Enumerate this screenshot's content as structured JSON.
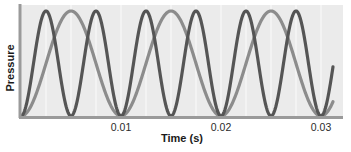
{
  "chart_data": {
    "type": "line",
    "title": "",
    "xlabel": "Time (s)",
    "ylabel": "Pressure",
    "xlim": [
      0,
      0.0322
    ],
    "ylim": [
      0,
      1
    ],
    "x_ticks": [
      0.01,
      0.02,
      0.03
    ],
    "x_tick_labels": [
      "0.01",
      "0.02",
      "0.03"
    ],
    "y_ticks": [],
    "grid": "vertical lines only",
    "legend": null,
    "series": [
      {
        "name": "higher-frequency wave",
        "color": "#555555",
        "frequency_hz": 200,
        "period_s": 0.005,
        "form": "pressure = (1 - cos(2*pi*f*t)) / 2",
        "t_start": 0,
        "t_end": 0.0312,
        "peaks_s": [
          0.0025,
          0.0075,
          0.0125,
          0.0175,
          0.0225,
          0.0275
        ],
        "troughs_s": [
          0,
          0.005,
          0.01,
          0.015,
          0.02,
          0.025,
          0.03
        ]
      },
      {
        "name": "lower-frequency wave",
        "color": "#8c8c8c",
        "frequency_hz": 100,
        "period_s": 0.01,
        "form": "pressure = (1 - cos(2*pi*f*t)) / 2",
        "t_start": 0,
        "t_end": 0.0312,
        "peaks_s": [
          0.005,
          0.015,
          0.025
        ],
        "troughs_s": [
          0,
          0.01,
          0.02,
          0.03
        ]
      }
    ]
  },
  "colors": {
    "plot_background": "#ebebeb",
    "gridline": "#f8f8f8",
    "axis": "#9a9a9a"
  }
}
